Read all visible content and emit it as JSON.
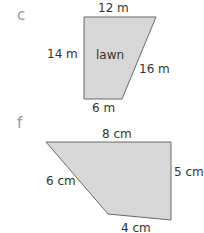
{
  "figures": [
    {
      "part_label": "c",
      "shape": "trapezium",
      "region_label": "lawn",
      "sides": {
        "top": "12 m",
        "left": "14 m",
        "slant": "16 m",
        "bottom": "6 m"
      }
    },
    {
      "part_label": "f",
      "shape": "irregular quadrilateral",
      "sides": {
        "top": "8 cm",
        "right": "5 cm",
        "slant": "6 cm",
        "bottom": "4 cm"
      }
    }
  ],
  "colors": {
    "fill": "#d7d7d7",
    "outline": "#6a6a6a",
    "text": "#333333",
    "part_label": "#9a9a9a"
  }
}
